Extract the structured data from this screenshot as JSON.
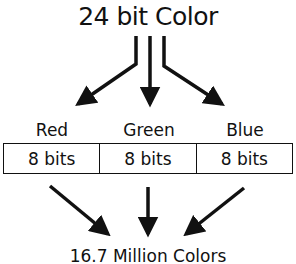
{
  "diagram": {
    "title": "24 bit Color",
    "channels": [
      {
        "name": "Red",
        "bits": "8 bits"
      },
      {
        "name": "Green",
        "bits": "8 bits"
      },
      {
        "name": "Blue",
        "bits": "8 bits"
      }
    ],
    "result": "16.7 Million Colors",
    "colors": {
      "ink": "#111111",
      "background": "#ffffff"
    }
  }
}
